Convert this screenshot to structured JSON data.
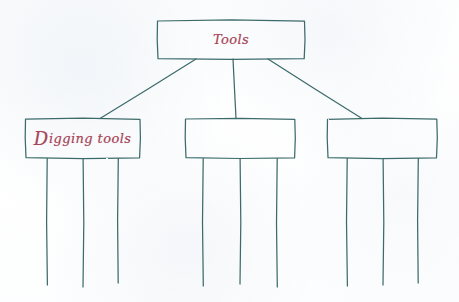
{
  "medium": {
    "description": "hand-drawn pencil and ink diagram on paper",
    "background_color": "#fdfdfd",
    "stroke_color": "#3d6b6b",
    "text_color": "#a8475a"
  },
  "diagram": {
    "type": "hierarchy-tree",
    "title_node": {
      "id": "root",
      "label": "Tools",
      "box": {
        "x": 157,
        "y": 20,
        "w": 148,
        "h": 39
      }
    },
    "children": [
      {
        "id": "child-0",
        "label": "Digging tools",
        "label_initial": "D",
        "label_rest": "igging tools",
        "filled": true,
        "box": {
          "x": 25,
          "y": 118,
          "w": 115,
          "h": 40
        },
        "stems": [
          {
            "x": 47,
            "y_top": 158,
            "y_bottom": 285
          },
          {
            "x": 83,
            "y_top": 158,
            "y_bottom": 287
          },
          {
            "x": 118,
            "y_top": 158,
            "y_bottom": 283
          }
        ]
      },
      {
        "id": "child-1",
        "label": "",
        "filled": false,
        "box": {
          "x": 185,
          "y": 118,
          "w": 110,
          "h": 40
        },
        "stems": [
          {
            "x": 203,
            "y_top": 158,
            "y_bottom": 286
          },
          {
            "x": 240,
            "y_top": 158,
            "y_bottom": 284
          },
          {
            "x": 277,
            "y_top": 158,
            "y_bottom": 287
          }
        ]
      },
      {
        "id": "child-2",
        "label": "",
        "filled": false,
        "box": {
          "x": 327,
          "y": 118,
          "w": 110,
          "h": 40
        },
        "stems": [
          {
            "x": 347,
            "y_top": 158,
            "y_bottom": 286
          },
          {
            "x": 383,
            "y_top": 158,
            "y_bottom": 285
          },
          {
            "x": 418,
            "y_top": 158,
            "y_bottom": 283
          }
        ]
      }
    ],
    "connectors": [
      {
        "from": "root",
        "to": "child-0",
        "x1": 196,
        "y1": 59,
        "x2": 100,
        "y2": 118
      },
      {
        "from": "root",
        "to": "child-1",
        "x1": 233,
        "y1": 59,
        "x2": 236,
        "y2": 118
      },
      {
        "from": "root",
        "to": "child-2",
        "x1": 268,
        "y1": 59,
        "x2": 362,
        "y2": 118
      }
    ]
  }
}
